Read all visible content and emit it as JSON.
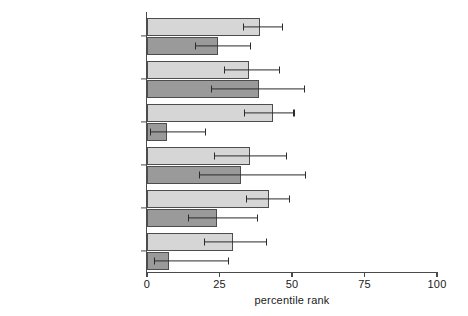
{
  "chart_data": {
    "type": "bar",
    "orientation": "horizontal",
    "title": "",
    "xlabel": "percentile rank",
    "ylabel": "",
    "xlim": [
      0,
      100
    ],
    "xticks": [
      0,
      25,
      50,
      75,
      100
    ],
    "xtick_labels": [
      "0",
      "25",
      "50",
      "75",
      "100"
    ],
    "grid": false,
    "legend": "none",
    "categories": [
      "voice and accountability",
      "political stability/no violence",
      "government effectiveness",
      "regulatory quality",
      "rule of law",
      "control of corruption"
    ],
    "series": [
      {
        "name": "light",
        "color": "#d6d6d6",
        "values": [
          39,
          35,
          43.5,
          35.5,
          42,
          29.5
        ],
        "ci_low": [
          33,
          26.5,
          33.5,
          23,
          34,
          19.5
        ],
        "ci_high": [
          46.5,
          45.5,
          50.5,
          48,
          49,
          41
        ]
      },
      {
        "name": "dark",
        "color": "#9a9a9a",
        "values": [
          24.5,
          38.5,
          7,
          32.5,
          24,
          7.5
        ],
        "ci_low": [
          16.5,
          22,
          1,
          18,
          14,
          2.5
        ],
        "ci_high": [
          35.5,
          54,
          20,
          54.5,
          38,
          28
        ]
      }
    ]
  },
  "axis": {
    "x_title": "percentile rank"
  }
}
